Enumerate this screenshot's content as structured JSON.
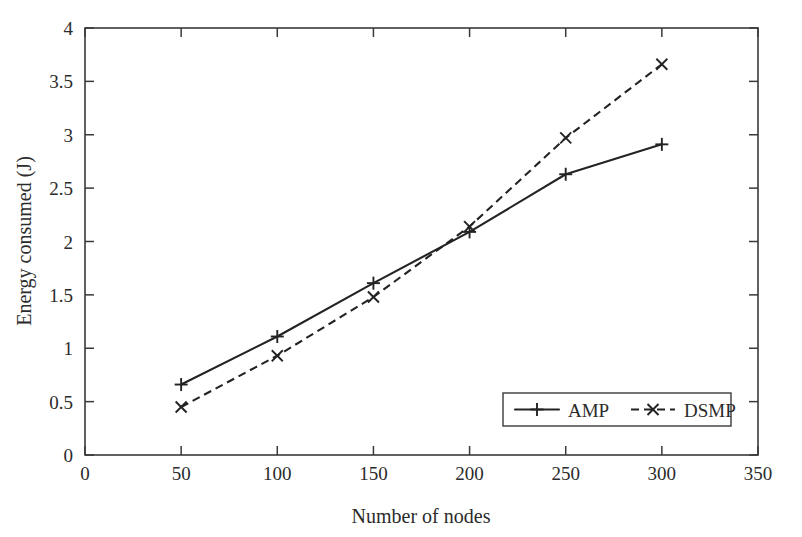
{
  "chart_data": {
    "type": "line",
    "title": "",
    "xlabel": "Number of nodes",
    "ylabel": "Energy consumed (J)",
    "xlim": [
      0,
      350
    ],
    "ylim": [
      0,
      4
    ],
    "x": [
      50,
      100,
      150,
      200,
      250,
      300
    ],
    "xticks": [
      "0",
      "50",
      "100",
      "150",
      "200",
      "250",
      "300",
      "350"
    ],
    "xtick_values": [
      0,
      50,
      100,
      150,
      200,
      250,
      300,
      350
    ],
    "yticks": [
      "0",
      "0.5",
      "1",
      "1.5",
      "2",
      "2.5",
      "3",
      "3.5",
      "4"
    ],
    "ytick_values": [
      0,
      0.5,
      1,
      1.5,
      2,
      2.5,
      3,
      3.5,
      4
    ],
    "grid": false,
    "legend_position": "bottom-right",
    "series": [
      {
        "name": "AMP",
        "values": [
          0.66,
          1.11,
          1.61,
          2.09,
          2.63,
          2.91
        ],
        "line_style": "solid",
        "marker": "plus",
        "color": "#232323"
      },
      {
        "name": "DSMP",
        "values": [
          0.45,
          0.93,
          1.48,
          2.14,
          2.97,
          3.66
        ],
        "line_style": "dashed",
        "marker": "cross",
        "color": "#232323"
      }
    ]
  },
  "legend": {
    "entries": [
      {
        "label": "AMP"
      },
      {
        "label": "DSMP"
      }
    ]
  }
}
